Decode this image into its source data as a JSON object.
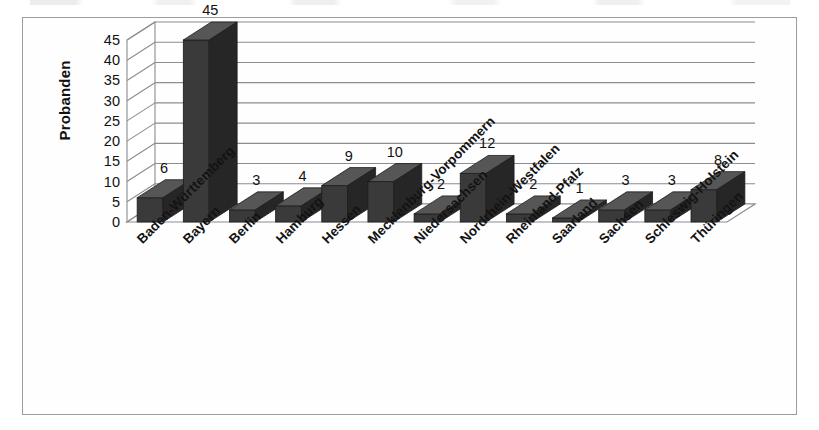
{
  "figure": {
    "frame_visible": true,
    "background_color": "#ffffff",
    "frame_color": "#9b9ba1",
    "bar_face_color": "#3a3a3a",
    "bar_top_color": "#565656",
    "bar_side_color": "#262626",
    "gridline_color": "#8c8c92",
    "text_color": "#111111"
  },
  "chart_data": {
    "type": "bar",
    "title": "",
    "subtitle": "",
    "xlabel": "",
    "ylabel": "Probanden",
    "ylim": [
      0,
      45
    ],
    "ytick_step": 5,
    "yticks": [
      "0",
      "5",
      "10",
      "15",
      "20",
      "25",
      "30",
      "35",
      "40",
      "45"
    ],
    "grid": true,
    "legend": "none",
    "three_d": true,
    "categories": [
      "Baden-Württemberg",
      "Bayern",
      "Berlin",
      "Hamburg",
      "Hessen",
      "Mecklenburg-Vorpommern",
      "Niedersachsen",
      "Nordrhein-Westfalen",
      "Rheinland-Pfalz",
      "Saarland",
      "Sachsen",
      "Schleswig-Holstein",
      "Thüringen"
    ],
    "values": [
      6,
      45,
      3,
      4,
      9,
      10,
      2,
      12,
      2,
      1,
      3,
      3,
      8
    ],
    "data_labels": [
      "6",
      "45",
      "3",
      "4",
      "9",
      "10",
      "2",
      "12",
      "2",
      "1",
      "3",
      "3",
      "8"
    ],
    "total": 108
  }
}
